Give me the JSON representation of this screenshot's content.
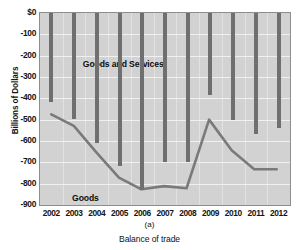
{
  "figure": {
    "panel_letter": "(a)",
    "caption": "Balance of trade"
  },
  "labels": {
    "series_bars": "Goods and Services",
    "series_line": "Goods"
  },
  "colors": {
    "plot_background": "#d2d2d2",
    "bar": "#6f6f6f",
    "line": "#7a7a7a",
    "gridline": "#f0f0f0",
    "axis": "#8d8d8d",
    "text": "#141414"
  },
  "chart_data": {
    "type": "bar",
    "title": "",
    "subtitle": "",
    "xlabel": "Balance of trade",
    "ylabel": "Billions of Dollars",
    "categories": [
      "2002",
      "2003",
      "2004",
      "2005",
      "2006",
      "2007",
      "2008",
      "2009",
      "2010",
      "2011",
      "2012"
    ],
    "ylim": [
      -900,
      0
    ],
    "yticks": [
      "$0",
      "-100",
      "-200",
      "-300",
      "-400",
      "-500",
      "-600",
      "-700",
      "-800",
      "-900"
    ],
    "ytick_values": [
      0,
      -100,
      -200,
      -300,
      -400,
      -500,
      -600,
      -700,
      -800,
      -900
    ],
    "grid": true,
    "legend_position": "inline-annotation",
    "series": [
      {
        "name": "Goods and Services",
        "type": "bar",
        "values": [
          -418,
          -495,
          -610,
          -715,
          -830,
          -700,
          -700,
          -385,
          -500,
          -565,
          -540
        ]
      },
      {
        "name": "Goods",
        "type": "line",
        "values": [
          -480,
          -535,
          -660,
          -780,
          -835,
          -820,
          -830,
          -505,
          -650,
          -740,
          -740
        ]
      }
    ],
    "annotations": [
      {
        "text": "Goods and Services",
        "x": "2004",
        "y": -240
      },
      {
        "text": "Goods",
        "x": "2003",
        "y": -865
      }
    ]
  }
}
